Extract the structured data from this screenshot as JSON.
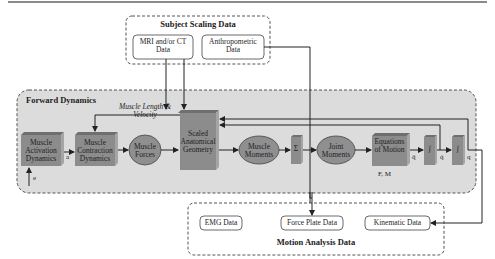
{
  "subject_scaling": {
    "title": "Subject Scaling Data",
    "mri": "MRI and/or CT Data",
    "anthro": "Anthropometric Data"
  },
  "forward_dynamics": {
    "title": "Forward Dynamics",
    "feedback_label": "Muscle Length & Velocity",
    "blocks": {
      "activation": "Muscle Activation Dynamics",
      "contraction": "Muscle Contraction Dynamics",
      "forces": "Muscle Forces",
      "geometry": "Scaled Anatomical Geometry",
      "moments": "Muscle Moments",
      "sum": "Σ",
      "joint": "Joint Moments",
      "eom": "Equations of Motion",
      "int1": "∫",
      "int2": "∫"
    },
    "signals": {
      "e": "e",
      "a": "a",
      "qdd": "q̈",
      "qd": "q̇",
      "q": "q",
      "fm": "F, M"
    }
  },
  "motion_analysis": {
    "title": "Motion Analysis Data",
    "emg": "EMG Data",
    "force_plate": "Force Plate Data",
    "kinematic": "Kinematic Data"
  },
  "colors": {
    "panel_bg": "#dcdcdc",
    "box_fill": "#8c8c8c",
    "box_top": "#6f6f6f",
    "box_side": "#a5a5a5",
    "ellipse_fill": "#8f8f8f",
    "line": "#333333"
  }
}
